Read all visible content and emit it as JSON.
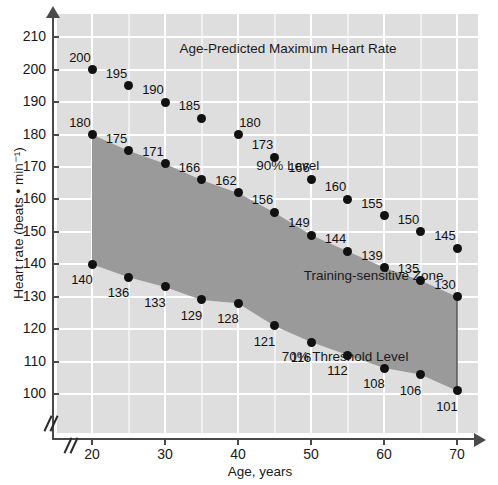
{
  "chart_data": {
    "type": "scatter",
    "title": "Age-Predicted Maximum Heart Rate",
    "xlabel": "Age, years",
    "ylabel": "Heart rate (beats • min⁻¹)",
    "xlim": [
      16,
      74
    ],
    "ylim": [
      95,
      215
    ],
    "xticks": [
      20,
      30,
      40,
      50,
      60,
      70
    ],
    "yticks": [
      100,
      110,
      120,
      130,
      140,
      150,
      160,
      170,
      180,
      190,
      200,
      210
    ],
    "grid": true,
    "axis_break_x": true,
    "annotations": [
      {
        "text": "Age-Predicted Maximum Heart Rate",
        "x": 32,
        "y": 206
      },
      {
        "text": "90% Level",
        "x": 42.5,
        "y": 170
      },
      {
        "text": "Training-sensitive Zone",
        "x": 49,
        "y": 136
      },
      {
        "text": "70% Threshold Level",
        "x": 46,
        "y": 111
      }
    ],
    "series": [
      {
        "name": "Maximum heart rate (100%)",
        "x": [
          20,
          25,
          30,
          35,
          40,
          45,
          50,
          55,
          60,
          65,
          70
        ],
        "values": [
          200,
          195,
          190,
          185,
          180,
          173,
          166,
          160,
          155,
          150,
          145
        ],
        "label_positions": [
          "above-left",
          "above-left",
          "above-left",
          "above-left",
          "above-right",
          "above-left",
          "above-left",
          "above-left",
          "above-left",
          "above-left",
          "above-left"
        ]
      },
      {
        "name": "90% Level",
        "x": [
          20,
          25,
          30,
          35,
          40,
          45,
          50,
          55,
          60,
          65,
          70
        ],
        "values": [
          180,
          175,
          171,
          166,
          162,
          156,
          149,
          144,
          139,
          135,
          130
        ],
        "label_positions": [
          "above-left",
          "above-left",
          "above-left",
          "above-left",
          "above-left",
          "above-left",
          "above-left",
          "above-left",
          "above-left",
          "above-left",
          "above-left"
        ]
      },
      {
        "name": "70% Threshold Level",
        "x": [
          20,
          25,
          30,
          35,
          40,
          45,
          50,
          55,
          60,
          65,
          70
        ],
        "values": [
          140,
          136,
          133,
          129,
          128,
          121,
          116,
          112,
          108,
          106,
          101
        ],
        "label_positions": [
          "below-left",
          "below-left",
          "below-left",
          "below-left",
          "below-left",
          "below-left",
          "below-left",
          "below-left",
          "below-left",
          "below-left",
          "below-left"
        ]
      }
    ],
    "zone_fill_color": "#9a9a9a",
    "background_color": "#dedede",
    "gridline_color": "#ffffff",
    "point_color": "#111111"
  }
}
